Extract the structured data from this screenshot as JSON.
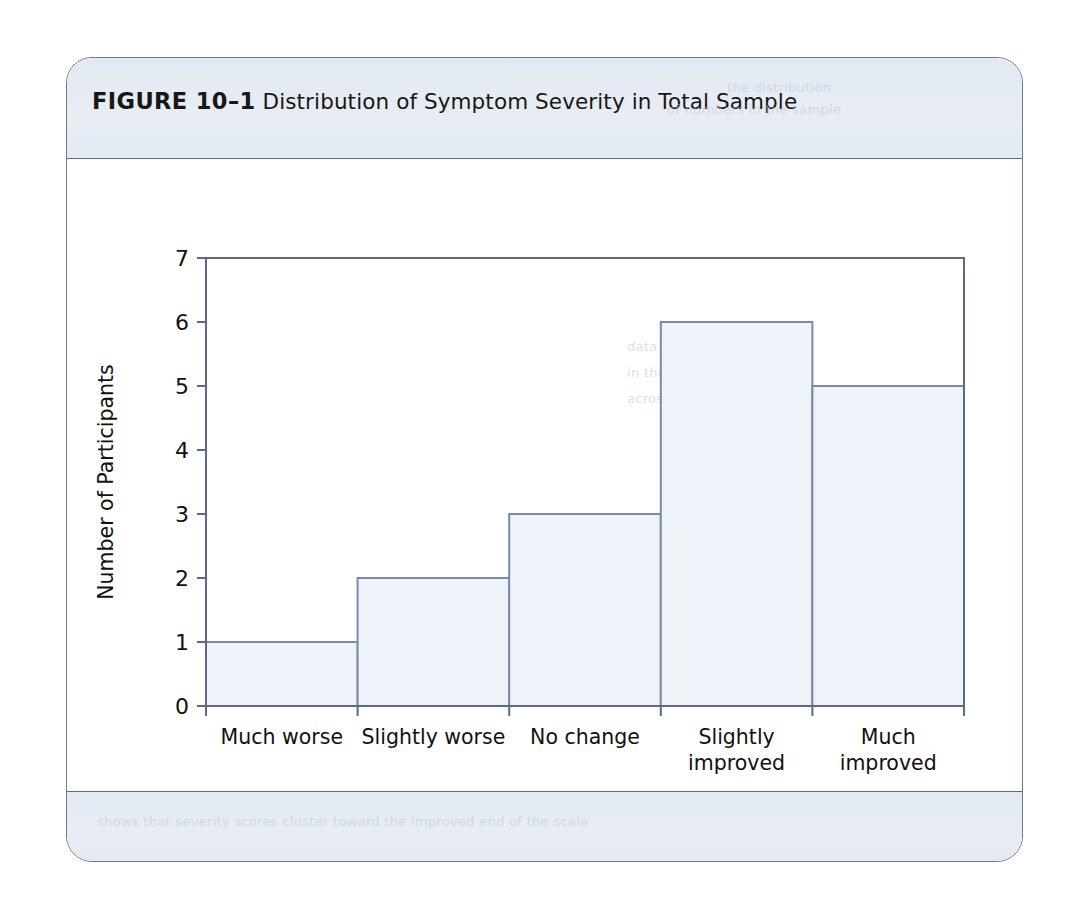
{
  "figure": {
    "label": "FIGURE 10–1",
    "title": "Distribution of Symptom Severity in Total Sample"
  },
  "ghost_text": {
    "top_right_line1": "the distribution",
    "top_right_line2": "of numbers in the sample",
    "mid_right_line1": "data set and the values",
    "mid_right_line2": "in the sample are spread",
    "mid_right_line3": "across the severity range",
    "footer_line": "shows that severity scores cluster toward the improved end of the scale"
  },
  "colors": {
    "card_border": "#6e7a95",
    "band_fill": "#e6ebf3",
    "bar_fill": "#eef3fa",
    "bar_stroke": "#7b8aa8",
    "axis": "#5d6a86",
    "text": "#111111"
  },
  "chart_data": {
    "type": "bar",
    "title": "Distribution of Symptom Severity in Total Sample",
    "xlabel": "Symptom Severity",
    "ylabel": "Number of Participants",
    "categories": [
      "Much worse",
      "Slightly worse",
      "No change",
      "Slightly improved",
      "Much improved"
    ],
    "category_lines": [
      [
        "Much worse"
      ],
      [
        "Slightly worse"
      ],
      [
        "No change"
      ],
      [
        "Slightly",
        "improved"
      ],
      [
        "Much",
        "improved"
      ]
    ],
    "values": [
      1,
      2,
      3,
      6,
      5
    ],
    "ylim": [
      0,
      7
    ],
    "yticks": [
      0,
      1,
      2,
      3,
      4,
      5,
      6,
      7
    ],
    "ytick_labels": [
      "0",
      "1",
      "2",
      "3",
      "4",
      "5",
      "6",
      "7"
    ],
    "grid": false,
    "legend": null,
    "bar_gap": 0,
    "style": "histogram"
  }
}
